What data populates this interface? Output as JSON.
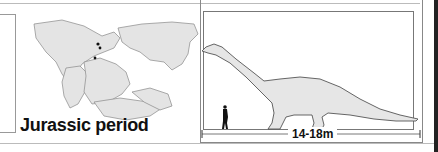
{
  "map": {
    "title": "Jurassic period",
    "fossil_sites": 3,
    "land_color": "#e4e4e4",
    "outline_color": "#777777"
  },
  "size_comparison": {
    "scale_label": "14-18m",
    "dinosaur_color": "#e6e6e6",
    "human_figure": "human-silhouette-icon"
  }
}
